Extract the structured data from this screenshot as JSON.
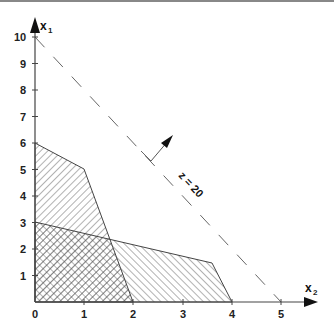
{
  "figure": {
    "type": "linear-programming-graph",
    "x_axis": {
      "label": "x",
      "subscript": "2",
      "ticks": [
        "0",
        "1",
        "2",
        "3",
        "4",
        "5"
      ]
    },
    "y_axis": {
      "label": "x",
      "subscript": "1",
      "ticks": [
        "1",
        "2",
        "3",
        "4",
        "5",
        "6",
        "7",
        "8",
        "9",
        "10"
      ]
    },
    "objective_line": {
      "label": "z = 20",
      "x2_intercept": 5,
      "x1_intercept": 10,
      "style": "dashed"
    },
    "regions": [
      {
        "name": "constraint-region-a",
        "vertices_x2_x1": [
          [
            0,
            0
          ],
          [
            0,
            6
          ],
          [
            1,
            5
          ],
          [
            2,
            0
          ]
        ],
        "hatch": "forward-diagonal"
      },
      {
        "name": "constraint-region-b",
        "vertices_x2_x1": [
          [
            0,
            0
          ],
          [
            0,
            3
          ],
          [
            3.6,
            1.5
          ],
          [
            4,
            0
          ]
        ],
        "hatch": "back-diagonal"
      }
    ],
    "overlap": {
      "name": "feasible-region",
      "hatch": "cross-hatch"
    },
    "colors": {
      "line": "#333333",
      "hatch": "#555555",
      "background": "#ffffff"
    }
  },
  "labels": {
    "x_axis_main": "x",
    "x_axis_sub": "2",
    "y_axis_main": "x",
    "y_axis_sub": "1",
    "z_label": "z = 20",
    "xt0": "0",
    "xt1": "1",
    "xt2": "2",
    "xt3": "3",
    "xt4": "4",
    "xt5": "5",
    "yt1": "1",
    "yt2": "2",
    "yt3": "3",
    "yt4": "4",
    "yt5": "5",
    "yt6": "6",
    "yt7": "7",
    "yt8": "8",
    "yt9": "9",
    "yt10": "10"
  }
}
